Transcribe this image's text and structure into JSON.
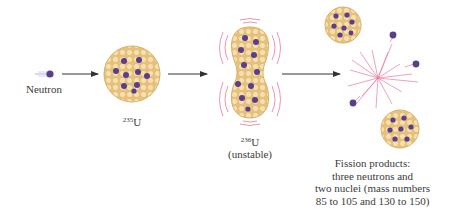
{
  "diagram": {
    "colors": {
      "nucleon": "#f2d49a",
      "nucleon_edge": "#d9b56a",
      "neutron": "#5a3e8c",
      "vibration": "#e06a8a",
      "arrow": "#333333"
    },
    "stages": [
      {
        "id": "neutron",
        "label": "Neutron"
      },
      {
        "id": "u235",
        "mass": "235",
        "symbol": "U"
      },
      {
        "id": "u236",
        "mass": "236",
        "symbol": "U",
        "note": "(unstable)"
      },
      {
        "id": "products",
        "lines": [
          "Fission products:",
          "three neutrons and",
          "two nuclei (mass numbers",
          "85 to 105 and 130 to 150)"
        ]
      }
    ]
  }
}
